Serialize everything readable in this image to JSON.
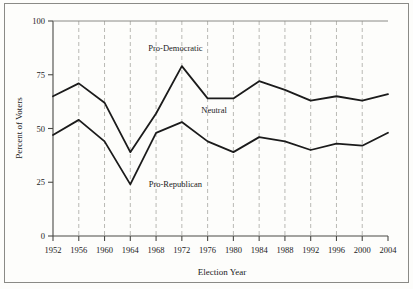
{
  "chart_data": {
    "type": "line",
    "title": "",
    "xlabel": "Election Year",
    "ylabel": "Percent of Voters",
    "x": [
      1952,
      1956,
      1960,
      1964,
      1968,
      1972,
      1976,
      1980,
      1984,
      1988,
      1992,
      1996,
      2000,
      2004
    ],
    "xticklabels": [
      "1952",
      "1956",
      "1960",
      "1964",
      "1968",
      "1972",
      "1976",
      "1980",
      "1984",
      "1988",
      "1992",
      "1996",
      "2000",
      "2004"
    ],
    "yticklabels": [
      "0",
      "25",
      "50",
      "75",
      "100"
    ],
    "yticks": [
      0,
      25,
      50,
      75,
      100
    ],
    "ylim": [
      0,
      100
    ],
    "xlim": [
      1952,
      2004
    ],
    "grid": "vertical-dashed",
    "legend_position": "inline-annotations",
    "series": [
      {
        "name": "upper-boundary",
        "description": "Cumulative boundary between Neutral and Pro-Democratic",
        "values": [
          65,
          71,
          62,
          39,
          57,
          79,
          64,
          64,
          72,
          68,
          63,
          65,
          63,
          66
        ]
      },
      {
        "name": "lower-boundary",
        "description": "Cumulative boundary between Pro-Republican and Neutral",
        "values": [
          47,
          54,
          44,
          24,
          48,
          53,
          44,
          39,
          46,
          44,
          40,
          43,
          42,
          48
        ]
      }
    ],
    "annotations": [
      {
        "text": "Pro-Democratic",
        "x": 1971,
        "y": 86
      },
      {
        "text": "Neutral",
        "x": 1977,
        "y": 57
      },
      {
        "text": "Pro-Republican",
        "x": 1971,
        "y": 23
      }
    ]
  },
  "axes": {
    "ylabel": "Percent of Voters",
    "xlabel": "Election Year"
  },
  "colors": {
    "line": "#1b1b1b",
    "grid": "#b9b9b4",
    "axis": "#4a4a46",
    "border": "#8a8a86",
    "background": "#fdfdfb"
  }
}
